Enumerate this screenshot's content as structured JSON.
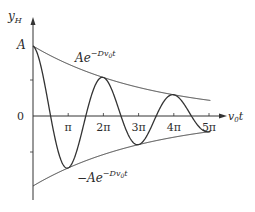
{
  "chart_data": {
    "type": "line",
    "title": "",
    "xlabel": "v0t",
    "ylabel": "y_H",
    "x_ticks": [
      "π",
      "2π",
      "3π",
      "4π",
      "5π"
    ],
    "y_ticks": [
      "A",
      "0"
    ],
    "series": [
      {
        "name": "y_H (damped oscillation)",
        "formula": "A e^{-D v0 t} cos(v0 t)",
        "damping_D": 0.095
      },
      {
        "name": "Ae^{-Dv0t}",
        "role": "upper envelope"
      },
      {
        "name": "-Ae^{-Dv0t}",
        "role": "lower envelope"
      }
    ],
    "xlim": [
      0,
      5.2
    ],
    "ylim": [
      -1.2,
      1.1
    ],
    "grid": false
  },
  "labels": {
    "y_axis": "y",
    "y_axis_sub": "H",
    "x_axis_main": "v",
    "x_axis_sub": "0",
    "x_axis_t": "t",
    "amp": "A",
    "zero": "0",
    "upper_env_main": "Ae",
    "upper_env_exp": "−Dv",
    "upper_env_exp_sub": "0",
    "upper_env_exp_t": "t",
    "lower_env_main": "−Ae",
    "lower_env_exp": "−Dv",
    "lower_env_exp_sub": "0",
    "lower_env_exp_t": "t",
    "ticks": [
      "π",
      "2π",
      "3π",
      "4π",
      "5π"
    ]
  }
}
